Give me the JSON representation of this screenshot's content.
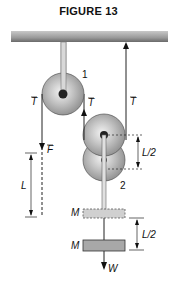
{
  "figure": {
    "title": "FIGURE 13",
    "pulleys": [
      {
        "id": "1",
        "label": "1"
      },
      {
        "id": "2",
        "label": "2"
      }
    ],
    "labels": {
      "tension_left": "T",
      "tension_middle": "T",
      "tension_right": "T",
      "force": "F",
      "length_left": "L",
      "length_half_upper": "L/2",
      "length_half_lower": "L/2",
      "mass_initial": "M",
      "mass_final": "M",
      "weight": "W"
    },
    "colors": {
      "ceiling": "#8a8a8a",
      "pulley": "#b5b5b5",
      "mass_initial": "#d0d0d0",
      "mass_final": "#a8a8a8"
    }
  }
}
